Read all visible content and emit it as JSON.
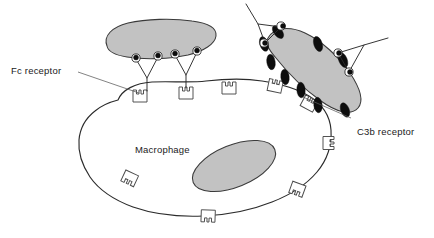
{
  "figure": {
    "background_color": "#ffffff"
  },
  "labels": {
    "fc_receptor": "Fc receptor",
    "c3b_receptor": "C3b receptor",
    "macrophage": "Macrophage"
  },
  "colors": {
    "cell_fill": "#ffffff",
    "nucleus_fill": "#c2c2c2",
    "bacterium_fill": "#c2c2c2",
    "outline": "#2b2b2b",
    "c3b_molecule": "#0d0d0d",
    "leader_line": "#5a5a5a",
    "text": "#1a1a1a"
  },
  "structures": {
    "macrophage": {
      "name": "Macrophage",
      "nucleus_label": "nucleus",
      "receptor_count": 9
    },
    "bacterium_left": {
      "name": "antibody-coated bacterium",
      "antibody_count": 2,
      "antigen_dot_count": 4
    },
    "bacterium_right": {
      "name": "C3b-opsonized bacterium",
      "c3b_molecule_count": 9,
      "antibody_count": 2
    }
  }
}
